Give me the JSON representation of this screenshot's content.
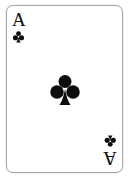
{
  "scene": {
    "name": "playing-card",
    "background_color": "#ffffff"
  },
  "card": {
    "rank": "A",
    "rank_name": "Ace",
    "suit": "clubs",
    "suit_symbol": "♣",
    "suit_color": "#0d0d0d",
    "card_name": "Ace of Clubs",
    "face_color": "#ffffff",
    "border_color": "#a8a8ad",
    "corner_top_left": {
      "rank": "A",
      "suit_symbol": "♣"
    },
    "corner_bottom_right": {
      "rank": "A",
      "suit_symbol": "♣"
    },
    "center_pip": {
      "suit_symbol": "♣",
      "count": 1
    }
  }
}
